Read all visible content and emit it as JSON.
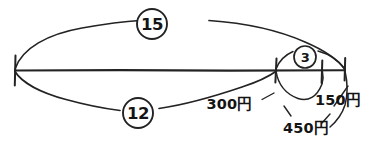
{
  "diagram": {
    "type": "hand-drawn-line-segment-diagram",
    "title": "",
    "background_color": "#ffffff",
    "ink_color": "#232323",
    "baseline": {
      "name": "horizontal-base-line",
      "x_start": 15,
      "x_end": 345,
      "y": 70
    },
    "ticks": [
      {
        "id": "tick-left-end",
        "x": 15,
        "y": 70
      },
      {
        "id": "tick-split-a",
        "x": 276,
        "y": 70
      },
      {
        "id": "tick-split-b",
        "x": 322,
        "y": 70
      },
      {
        "id": "tick-right-end",
        "x": 345,
        "y": 70
      }
    ],
    "arc_labels": [
      {
        "id": "arc-label-15",
        "value": "15",
        "shape": "circle",
        "size": "large",
        "cx": 152,
        "cy": 24,
        "r": 15,
        "spans": "full-span-top",
        "span_from": 15,
        "span_to": 345
      },
      {
        "id": "arc-label-12",
        "value": "12",
        "shape": "circle",
        "size": "large",
        "cx": 138,
        "cy": 113,
        "r": 15,
        "spans": "left-segment-bottom",
        "span_from": 15,
        "span_to": 276
      },
      {
        "id": "arc-label-3",
        "value": "3",
        "shape": "circle",
        "size": "small",
        "cx": 305,
        "cy": 57,
        "r": 11,
        "spans": "right-segment-top",
        "span_from": 276,
        "span_to": 345
      }
    ],
    "price_labels": [
      {
        "id": "price-300",
        "text": "300円",
        "amount": 300,
        "currency": "円",
        "x": 229,
        "y": 104,
        "points_to_tick": "tick-split-a"
      },
      {
        "id": "price-450",
        "text": "450円",
        "amount": 450,
        "currency": "円",
        "x": 283,
        "y": 128,
        "points_to_tick": "tick-split-b"
      },
      {
        "id": "price-150",
        "text": "150円",
        "amount": 150,
        "currency": "円",
        "x": 315,
        "y": 100,
        "points_to_tick": "tick-right-end"
      }
    ]
  }
}
